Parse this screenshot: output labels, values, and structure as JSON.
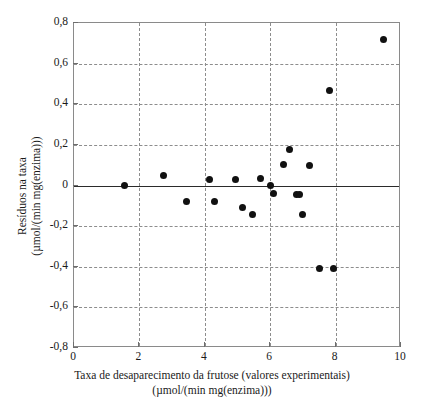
{
  "figure": {
    "kind": "scatter-residual-plot",
    "background_color": "#ffffff",
    "marker_color": "#111111",
    "grid_color": "#8d8d8d",
    "frame_color": "#8a8a8a",
    "zero_line_color": "#2b2b2b"
  },
  "axes": {
    "y_title_line1": "Resíduos na taxa",
    "y_title_line2": "(µmol/(min mg(enzima)))",
    "x_title_line1": "Taxa de desaparecimento da frutose (valores experimentais)",
    "x_title_line2": "(µmol/(min mg(enzima)))",
    "y_ticks": [
      "0,8",
      "0,6",
      "0,4",
      "0,2",
      "0",
      "-0,2",
      "-0,4",
      "-0,6",
      "-0,8"
    ],
    "x_ticks": [
      "0",
      "2",
      "4",
      "6",
      "8",
      "10"
    ]
  },
  "chart_data": {
    "type": "scatter",
    "title": "",
    "xlabel": "Taxa de desaparecimento da frutose (valores experimentais) (µmol/(min mg(enzima)))",
    "ylabel": "Resíduos na taxa (µmol/(min mg(enzima)))",
    "xlim": [
      0,
      10
    ],
    "ylim": [
      -0.8,
      0.8
    ],
    "xticks": [
      0,
      2,
      4,
      6,
      8,
      10
    ],
    "yticks": [
      -0.8,
      -0.6,
      -0.4,
      -0.2,
      0,
      0.2,
      0.4,
      0.6,
      0.8
    ],
    "grid": true,
    "grid_style": "dashed",
    "legend": "none",
    "reference_line_y": 0,
    "marker": "filled-circle",
    "x": [
      1.55,
      2.75,
      3.45,
      4.15,
      4.3,
      4.95,
      5.15,
      5.45,
      5.7,
      6.0,
      6.1,
      6.4,
      6.6,
      6.8,
      6.85,
      6.9,
      7.0,
      7.2,
      7.5,
      7.8,
      7.95,
      9.45
    ],
    "y": [
      0.0,
      0.05,
      -0.08,
      0.03,
      -0.08,
      0.03,
      -0.11,
      -0.145,
      0.035,
      0.0,
      -0.04,
      0.105,
      0.175,
      -0.045,
      -0.045,
      -0.045,
      -0.145,
      0.1,
      -0.41,
      0.47,
      -0.41,
      0.72
    ],
    "points": [
      {
        "x": 1.55,
        "y": 0.0
      },
      {
        "x": 2.75,
        "y": 0.05
      },
      {
        "x": 3.45,
        "y": -0.08
      },
      {
        "x": 4.15,
        "y": 0.03
      },
      {
        "x": 4.3,
        "y": -0.08
      },
      {
        "x": 4.95,
        "y": 0.03
      },
      {
        "x": 5.15,
        "y": -0.11
      },
      {
        "x": 5.45,
        "y": -0.145
      },
      {
        "x": 5.7,
        "y": 0.035
      },
      {
        "x": 6.0,
        "y": 0.0
      },
      {
        "x": 6.1,
        "y": -0.04
      },
      {
        "x": 6.4,
        "y": 0.105
      },
      {
        "x": 6.6,
        "y": 0.175
      },
      {
        "x": 6.8,
        "y": -0.045
      },
      {
        "x": 6.9,
        "y": -0.045
      },
      {
        "x": 7.0,
        "y": -0.145
      },
      {
        "x": 7.2,
        "y": 0.1
      },
      {
        "x": 7.5,
        "y": -0.41
      },
      {
        "x": 7.8,
        "y": 0.47
      },
      {
        "x": 7.95,
        "y": -0.41
      },
      {
        "x": 9.45,
        "y": 0.72
      }
    ]
  }
}
